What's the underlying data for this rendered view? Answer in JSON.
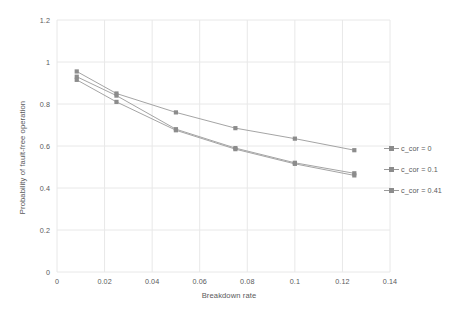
{
  "chart_data": {
    "type": "line",
    "title": "",
    "xlabel": "Breakdown rate",
    "ylabel": "Probability of fault-free operation",
    "xlim": [
      0,
      0.14
    ],
    "ylim": [
      0,
      1.2
    ],
    "grid": true,
    "legend_position": "right",
    "x_ticks": [
      "0",
      "0.02",
      "0.04",
      "0.06",
      "0.08",
      "0.1",
      "0.12",
      "0.14"
    ],
    "x_tick_values": [
      0,
      0.02,
      0.04,
      0.06,
      0.08,
      0.1,
      0.12,
      0.14
    ],
    "y_ticks": [
      "0",
      "0.2",
      "0.4",
      "0.6",
      "0.8",
      "1",
      "1.2"
    ],
    "y_tick_values": [
      0,
      0.2,
      0.4,
      0.6,
      0.8,
      1,
      1.2
    ],
    "x": [
      0.0083,
      0.025,
      0.05,
      0.075,
      0.1,
      0.125
    ],
    "series": [
      {
        "name": "c_cor = 0",
        "color": "#9a9a9a",
        "marker": "square",
        "values": [
          0.955,
          0.85,
          0.76,
          0.685,
          0.635,
          0.58
        ]
      },
      {
        "name": "c_cor = 0.1",
        "color": "#9a9a9a",
        "marker": "square",
        "values": [
          0.93,
          0.84,
          0.68,
          0.59,
          0.52,
          0.47
        ]
      },
      {
        "name": "c_cor = 0.41",
        "color": "#9a9a9a",
        "marker": "square",
        "values": [
          0.915,
          0.81,
          0.675,
          0.585,
          0.515,
          0.46
        ]
      }
    ]
  },
  "colors": {
    "background": "#ffffff",
    "grid": "#e8e8e8",
    "axis_text": "#59595b",
    "series_line": "#9a9a9a",
    "marker": "#8c8c8c"
  }
}
